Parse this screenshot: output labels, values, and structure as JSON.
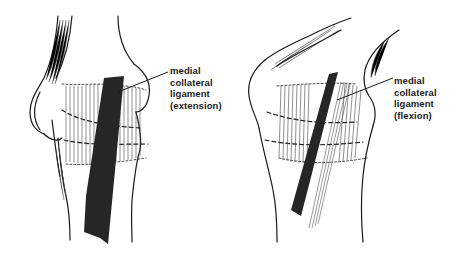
{
  "figures": [
    {
      "id": "extension",
      "label_lines": [
        "medial",
        "collateral",
        "ligament",
        "(extension)"
      ],
      "structure": "medial collateral ligament",
      "position": "extension"
    },
    {
      "id": "flexion",
      "label_lines": [
        "medial",
        "collateral",
        "ligament",
        "(flexion)"
      ],
      "structure": "medial collateral ligament",
      "position": "flexion"
    }
  ],
  "colors": {
    "ink": "#1a1a1a",
    "ligament": "#262626",
    "background": "#ffffff"
  }
}
